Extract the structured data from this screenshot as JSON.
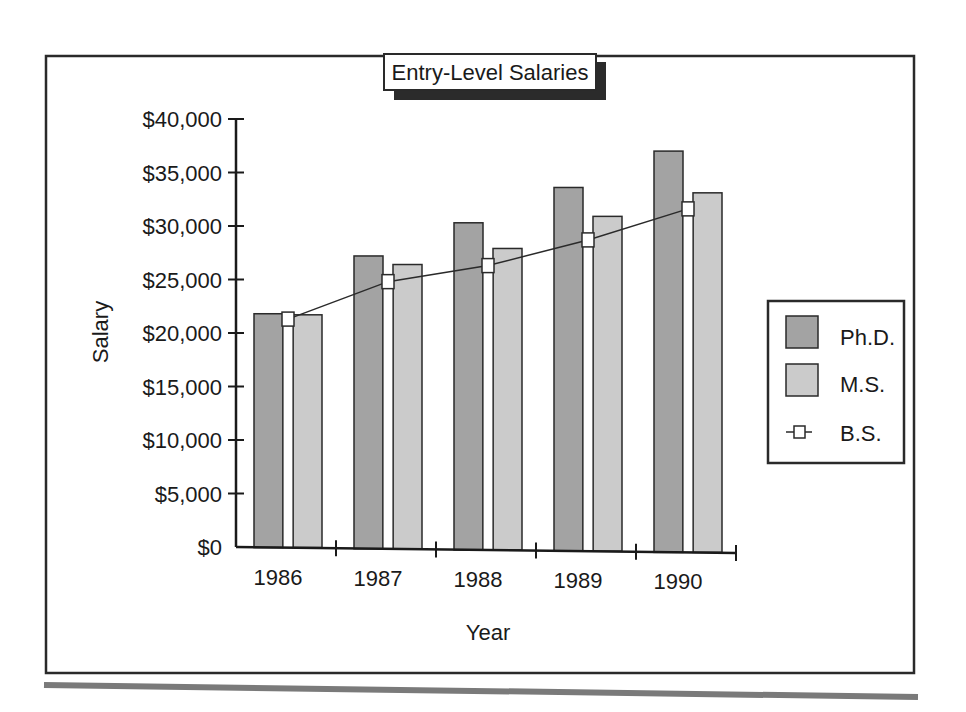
{
  "chart_data": {
    "type": "bar",
    "title": "Entry-Level Salaries",
    "xlabel": "Year",
    "ylabel": "Salary",
    "categories": [
      "1986",
      "1987",
      "1988",
      "1989",
      "1990"
    ],
    "ylim": [
      0,
      40000
    ],
    "yticks": [
      0,
      5000,
      10000,
      15000,
      20000,
      25000,
      30000,
      35000,
      40000
    ],
    "ytick_labels": [
      "$0",
      "$5,000",
      "$10,000",
      "$15,000",
      "$20,000",
      "$25,000",
      "$30,000",
      "$35,000",
      "$40,000"
    ],
    "grid": false,
    "legend_position": "right",
    "series": [
      {
        "name": "Ph.D.",
        "kind": "bar",
        "color": "#a3a3a3",
        "values": [
          21800,
          27200,
          30300,
          33600,
          37000
        ]
      },
      {
        "name": "M.S.",
        "kind": "bar",
        "color": "#cbcbcb",
        "values": [
          21700,
          26400,
          27900,
          30900,
          33100
        ]
      },
      {
        "name": "B.S.",
        "kind": "line",
        "marker": "square",
        "color": "#2a2a2a",
        "values": [
          21300,
          24800,
          26300,
          28700,
          31600
        ]
      }
    ]
  },
  "legend": {
    "items": [
      {
        "label": "Ph.D.",
        "symbol": "filled-square",
        "color": "#a3a3a3"
      },
      {
        "label": "M.S.",
        "symbol": "filled-square",
        "color": "#cbcbcb"
      },
      {
        "label": "B.S.",
        "symbol": "line-square-marker",
        "color": "#2a2a2a"
      }
    ]
  }
}
